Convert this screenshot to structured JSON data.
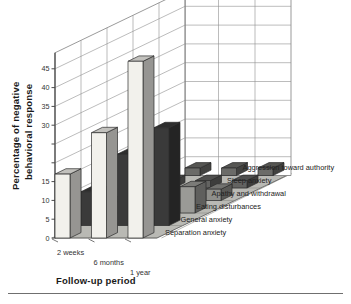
{
  "chart_data": {
    "type": "bar",
    "render": "3d-grouped-bar",
    "title": "",
    "xlabel": "Follow-up period",
    "ylabel": "Percentage of negative behavioral response",
    "zlabel": "",
    "categories": [
      "2 weeks",
      "6 months",
      "1 year"
    ],
    "ylim": [
      0,
      45
    ],
    "yticks": [
      0,
      5,
      10,
      15,
      20,
      25,
      30,
      35,
      40,
      45
    ],
    "ytick_labels": [
      "0",
      "5",
      "10",
      "15",
      "",
      "",
      "30",
      "35",
      "40",
      "45"
    ],
    "grid": true,
    "legend_position": "right-inline-depth-axis",
    "series": [
      {
        "name": "Separation anxiety",
        "color": "#f2f1ec",
        "values": [
          17,
          28,
          47
        ]
      },
      {
        "name": "General anxiety",
        "color": "#3a3a3a",
        "values": [
          9,
          19,
          26
        ]
      },
      {
        "name": "Eating disturbances",
        "color": "#9a9a96",
        "values": [
          3,
          5,
          7
        ]
      },
      {
        "name": "Apathy and withdrawal",
        "color": "#8f8f8b",
        "values": [
          2,
          2,
          3
        ]
      },
      {
        "name": "Sleep anxiety",
        "color": "#636361",
        "values": [
          2,
          2,
          2
        ]
      },
      {
        "name": "Aggression toward authority",
        "color": "#6b6b68",
        "values": [
          2,
          2,
          2
        ]
      }
    ]
  },
  "axes": {
    "y_title_line1": "Percentage of negative",
    "y_title_line2": "behavioral response",
    "x_title": "Follow-up period"
  }
}
